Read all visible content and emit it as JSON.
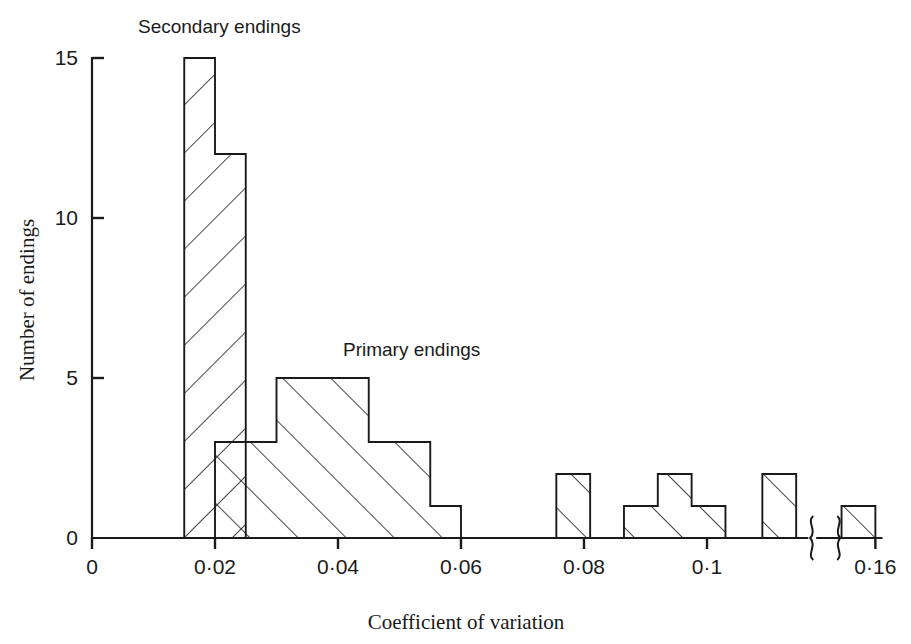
{
  "figure": {
    "background": "#ffffff",
    "ink": "#1a1a1a"
  },
  "chart_data": {
    "type": "bar",
    "title": "",
    "xlabel": "Coefficient of variation",
    "ylabel": "Number of endings",
    "xlim": [
      0,
      0.16
    ],
    "ylim": [
      0,
      15
    ],
    "grid": false,
    "axis_break": {
      "present": true,
      "between": [
        0.115,
        0.1525
      ],
      "symbol": "curly-break"
    },
    "x_ticks": [
      {
        "value": 0,
        "label": "0"
      },
      {
        "value": 0.02,
        "label": "0·02"
      },
      {
        "value": 0.04,
        "label": "0·04"
      },
      {
        "value": 0.06,
        "label": "0·06"
      },
      {
        "value": 0.08,
        "label": "0·08"
      },
      {
        "value": 0.1,
        "label": "0·1"
      },
      {
        "value": 0.16,
        "label": "0·16"
      }
    ],
    "y_ticks": [
      {
        "value": 0,
        "label": "0"
      },
      {
        "value": 5,
        "label": "5"
      },
      {
        "value": 10,
        "label": "10"
      },
      {
        "value": 15,
        "label": "15"
      }
    ],
    "bin_width": 0.005,
    "series": [
      {
        "name": "Secondary endings",
        "hatch": "backward",
        "label_x": 0.0255,
        "label_y": 15.6,
        "bins": [
          {
            "x0": 0.015,
            "x1": 0.02,
            "count": 15
          },
          {
            "x0": 0.02,
            "x1": 0.025,
            "count": 12
          }
        ]
      },
      {
        "name": "Primary endings",
        "hatch": "forward",
        "label_x": 0.0412,
        "label_y": 6.1,
        "bins": [
          {
            "x0": 0.02,
            "x1": 0.025,
            "count": 3
          },
          {
            "x0": 0.025,
            "x1": 0.03,
            "count": 3
          },
          {
            "x0": 0.03,
            "x1": 0.045,
            "count": 5
          },
          {
            "x0": 0.045,
            "x1": 0.055,
            "count": 3
          },
          {
            "x0": 0.055,
            "x1": 0.06,
            "count": 1
          },
          {
            "x0": 0.0755,
            "x1": 0.081,
            "count": 2
          },
          {
            "x0": 0.0865,
            "x1": 0.092,
            "count": 1
          },
          {
            "x0": 0.092,
            "x1": 0.0975,
            "count": 2
          },
          {
            "x0": 0.0975,
            "x1": 0.103,
            "count": 1
          },
          {
            "x0": 0.109,
            "x1": 0.1145,
            "count": 2
          },
          {
            "x0": 0.1545,
            "x1": 0.16,
            "count": 1
          }
        ]
      }
    ],
    "series_labels": [
      {
        "text": "Secondary endings",
        "x": 138,
        "y": 33
      },
      {
        "text": "Primary endings",
        "x": 343,
        "y": 356
      }
    ]
  }
}
